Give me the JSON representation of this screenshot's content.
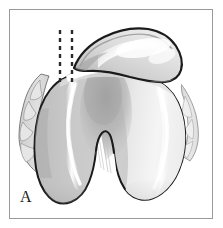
{
  "figure": {
    "panel_label": "A",
    "caption_text": "",
    "title": "",
    "view": "axial view of distal femur with patella",
    "background_color": "#ffffff",
    "frame_color": "#9a9a9a",
    "outline_color": "#1a1a1a",
    "bone_fill_light": "#e9e9e9",
    "bone_fill_mid": "#c9c9c9",
    "bone_fill_dark": "#a8a8a8",
    "highlight_color": "#ffffff",
    "cartilage_fill": "#dcdcdc"
  },
  "structures": {
    "patella": {
      "name": "patella",
      "label": "",
      "fill": "#cfcfcf"
    },
    "lateral_condyle": {
      "name": "lateral-femoral-condyle",
      "label": "",
      "fill": "#efefef"
    },
    "medial_condyle": {
      "name": "medial-femoral-condyle",
      "label": "",
      "fill": "#c6c6c6"
    },
    "trochlear_groove": {
      "name": "trochlear-groove",
      "label": "",
      "fill": "#b5b5b5"
    },
    "intercondylar_notch": {
      "name": "intercondylar-notch",
      "label": "",
      "fill": "#ffffff"
    },
    "joint_space": {
      "name": "patellofemoral-joint-space",
      "label": "",
      "fill": "#ffffff"
    },
    "cartilage_margin": {
      "name": "scalloped-cartilage-margin",
      "label": "",
      "fill": "#dadada"
    }
  },
  "annotations": {
    "dashed_lines": [
      {
        "name": "reference-line-left",
        "x": 60,
        "y_top": 30,
        "y_bottom": 82,
        "color": "#2a2a2a",
        "dash": "4 4",
        "width": 2.4
      },
      {
        "name": "reference-line-right",
        "x": 72,
        "y_top": 30,
        "y_bottom": 82,
        "color": "#2a2a2a",
        "dash": "4 4",
        "width": 2.4
      }
    ]
  }
}
